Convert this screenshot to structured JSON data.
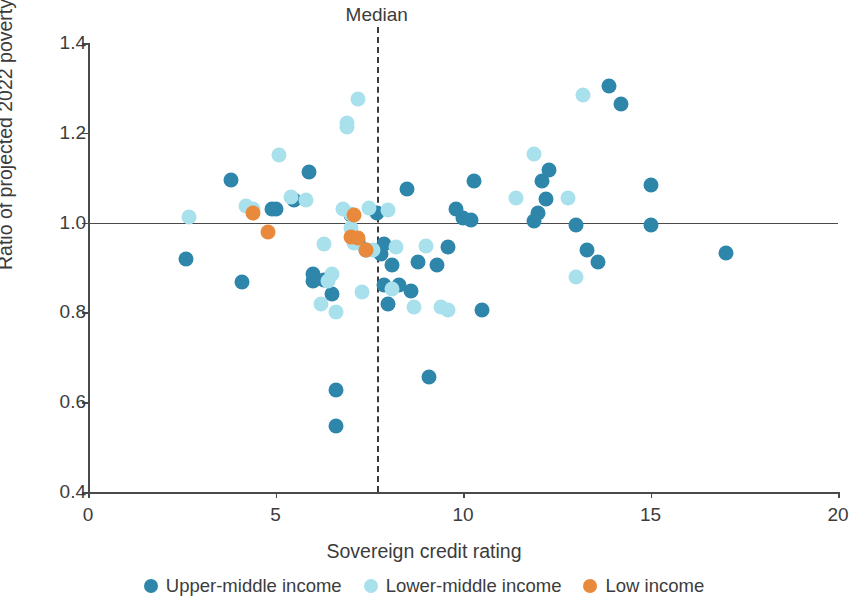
{
  "chart_data": {
    "type": "scatter",
    "title": "",
    "xlabel": "Sovereign credit rating",
    "ylabel": "Ratio of projected 2022 poverty rate to 2019 poverty rate",
    "xlim": [
      0,
      20
    ],
    "ylim": [
      0.4,
      1.4
    ],
    "xticks": [
      "0",
      "5",
      "10",
      "15",
      "20"
    ],
    "xtick_values": [
      0,
      5,
      10,
      15,
      20
    ],
    "yticks": [
      "0.4",
      "0.6",
      "0.8",
      "1.0",
      "1.2",
      "1.4"
    ],
    "ytick_values": [
      0.4,
      0.6,
      0.8,
      1.0,
      1.2,
      1.4
    ],
    "grid": false,
    "legend_position": "bottom",
    "annotations": [
      {
        "name": "median-line",
        "label": "Median",
        "type": "vline",
        "x": 7.7
      },
      {
        "name": "unity-reference-line",
        "label": "",
        "type": "hline",
        "y": 1.0
      }
    ],
    "colors": {
      "upper_middle": "#2E86AB",
      "lower_middle": "#A8E0EC",
      "low": "#E8893C",
      "axis": "#4a4a4a",
      "text": "#3c3c3c",
      "background": "#ffffff"
    },
    "series": [
      {
        "name": "Upper-middle income",
        "color": "#2E86AB",
        "points": [
          [
            2.6,
            0.92
          ],
          [
            3.8,
            1.095
          ],
          [
            4.1,
            0.868
          ],
          [
            5.0,
            1.03
          ],
          [
            5.5,
            1.05
          ],
          [
            5.9,
            1.112
          ],
          [
            6.0,
            0.885
          ],
          [
            6.0,
            0.87
          ],
          [
            6.3,
            0.872
          ],
          [
            6.5,
            0.84
          ],
          [
            6.6,
            0.627
          ],
          [
            6.6,
            0.547
          ],
          [
            7.0,
            1.018
          ],
          [
            7.2,
            0.96
          ],
          [
            7.4,
            0.94
          ],
          [
            7.7,
            1.022
          ],
          [
            7.9,
            0.952
          ],
          [
            7.9,
            0.862
          ],
          [
            8.0,
            0.818
          ],
          [
            8.1,
            0.905
          ],
          [
            8.3,
            0.862
          ],
          [
            8.5,
            1.075
          ],
          [
            8.6,
            0.848
          ],
          [
            9.1,
            0.657
          ],
          [
            9.3,
            0.905
          ],
          [
            9.6,
            0.945
          ],
          [
            9.8,
            1.03
          ],
          [
            10.0,
            1.01
          ],
          [
            10.2,
            1.005
          ],
          [
            10.3,
            1.093
          ],
          [
            10.5,
            0.805
          ],
          [
            11.9,
            1.003
          ],
          [
            12.0,
            1.022
          ],
          [
            12.1,
            1.093
          ],
          [
            12.2,
            1.053
          ],
          [
            12.3,
            1.118
          ],
          [
            13.0,
            0.995
          ],
          [
            13.3,
            0.938
          ],
          [
            13.6,
            0.912
          ],
          [
            13.9,
            1.305
          ],
          [
            14.2,
            1.265
          ],
          [
            15.0,
            0.995
          ],
          [
            15.0,
            1.083
          ],
          [
            17.0,
            0.932
          ],
          [
            4.9,
            1.03
          ],
          [
            7.8,
            0.93
          ],
          [
            8.8,
            0.912
          ]
        ]
      },
      {
        "name": "Lower-middle income",
        "color": "#A8E0EC",
        "points": [
          [
            2.7,
            1.012
          ],
          [
            4.2,
            1.038
          ],
          [
            4.4,
            1.03
          ],
          [
            5.1,
            1.15
          ],
          [
            5.4,
            1.057
          ],
          [
            5.8,
            1.05
          ],
          [
            6.2,
            0.818
          ],
          [
            6.4,
            0.87
          ],
          [
            6.5,
            0.885
          ],
          [
            6.6,
            0.8
          ],
          [
            6.9,
            1.222
          ],
          [
            6.9,
            1.212
          ],
          [
            6.8,
            1.03
          ],
          [
            7.0,
            1.02
          ],
          [
            7.0,
            0.988
          ],
          [
            7.1,
            0.955
          ],
          [
            7.2,
            1.275
          ],
          [
            7.3,
            0.845
          ],
          [
            7.5,
            1.032
          ],
          [
            8.0,
            1.028
          ],
          [
            8.1,
            0.852
          ],
          [
            8.2,
            0.945
          ],
          [
            8.7,
            0.812
          ],
          [
            9.0,
            0.948
          ],
          [
            9.4,
            0.812
          ],
          [
            9.6,
            0.805
          ],
          [
            11.4,
            1.055
          ],
          [
            11.9,
            1.152
          ],
          [
            12.8,
            1.055
          ],
          [
            13.0,
            0.878
          ],
          [
            13.2,
            1.285
          ],
          [
            7.6,
            0.94
          ],
          [
            6.3,
            0.952
          ]
        ]
      },
      {
        "name": "Low income",
        "color": "#E8893C",
        "points": [
          [
            4.4,
            1.022
          ],
          [
            4.8,
            0.98
          ],
          [
            7.1,
            1.018
          ],
          [
            7.0,
            0.968
          ],
          [
            7.2,
            0.965
          ],
          [
            7.4,
            0.938
          ]
        ]
      }
    ]
  },
  "axes": {
    "x_title": "Sovereign credit rating",
    "y_title": "Ratio of projected 2022 poverty rate to 2019 poverty rate"
  },
  "annotation": {
    "median_label": "Median"
  },
  "legend": {
    "items": [
      {
        "label": "Upper-middle income",
        "color": "#2E86AB"
      },
      {
        "label": "Lower-middle income",
        "color": "#A8E0EC"
      },
      {
        "label": "Low income",
        "color": "#E8893C"
      }
    ]
  }
}
